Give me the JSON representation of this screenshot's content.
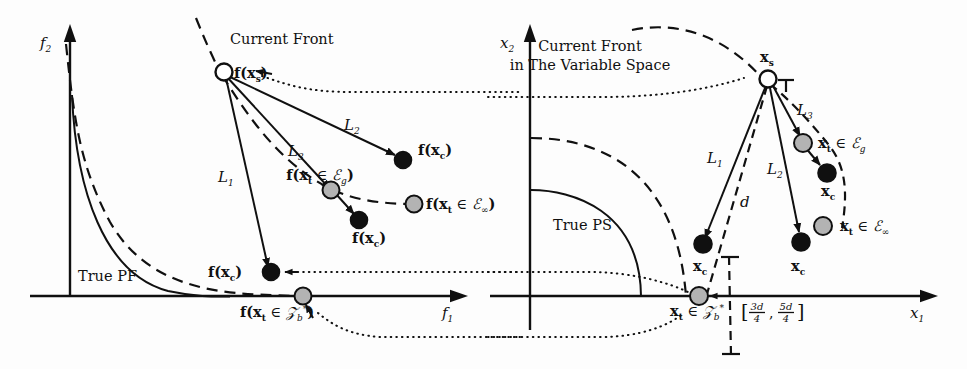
{
  "figure": {
    "title_alt": "Illustration of current front in objective space and variable space",
    "background": "#fdfdfd",
    "ink": "#101010",
    "grey_fill": "#b3b3b3",
    "black_fill": "#101010",
    "white_fill": "#ffffff"
  },
  "left_panel": {
    "name": "objective-space-plot",
    "axis_y_label": "f",
    "axis_y_sub": "2",
    "axis_x_label": "f",
    "axis_x_sub": "1",
    "curve_label_true": "True PF",
    "front_label": "Current Front",
    "labels": {
      "source_point": "f(x",
      "source_point_sub": "s",
      "source_point_close": ")",
      "L1": "L",
      "L1_sub": "1",
      "L2": "L",
      "L2_sub": "2",
      "L3": "L",
      "L3_sub": "3",
      "child_a": "f(x",
      "child_a_sub": "c",
      "child_a_close": ")",
      "child_b": "f(x",
      "child_b_sub": "c",
      "child_b_close": ")",
      "child_c": "f(x",
      "child_c_sub": "c",
      "child_c_close": ")",
      "target_g_open": "f(x",
      "target_g_sub": "t",
      "target_g_mid": " ∈ ",
      "target_g_set": "ℰ",
      "target_g_set_sub": "g",
      "target_g_close": ")",
      "target_inf_open": "f(x",
      "target_inf_sub": "t",
      "target_inf_mid": " ∈ ",
      "target_inf_set": "ℰ",
      "target_inf_set_sub": "∞",
      "target_inf_close": ")",
      "target_zb_open": "f(x",
      "target_zb_sub": "t",
      "target_zb_mid": " ∈ ",
      "target_zb_set": "𝒵",
      "target_zb_set_sub": "b",
      "target_zb_set_sup": "*",
      "target_zb_close": ")"
    }
  },
  "right_panel": {
    "name": "variable-space-plot",
    "axis_y_label": "x",
    "axis_y_sub": "2",
    "axis_x_label": "x",
    "axis_x_sub": "1",
    "curve_label_true": "True PS",
    "front_label_line1": "Current Front",
    "front_label_line2": "in The Variable Space",
    "labels": {
      "source_point": "x",
      "source_point_sub": "s",
      "L1": "L",
      "L1_sub": "1",
      "L2": "L",
      "L2_sub": "2",
      "L3": "L",
      "L3_sub": "3",
      "d_label": "d",
      "child_a": "x",
      "child_a_sub": "c",
      "child_b": "x",
      "child_b_sub": "c",
      "child_c": "x",
      "child_c_sub": "c",
      "target_g_open": "x",
      "target_g_sub": "t",
      "target_g_mid": " ∈ ",
      "target_g_set": "ℰ",
      "target_g_set_sub": "g",
      "target_inf_open": "x",
      "target_inf_sub": "t",
      "target_inf_mid": " ∈ ",
      "target_inf_set": "ℰ",
      "target_inf_set_sub": "∞",
      "target_zb_open": "x",
      "target_zb_sub": "t",
      "target_zb_mid": " ∈ ",
      "target_zb_set": "𝒵",
      "target_zb_set_sub": "b",
      "target_zb_set_sup": "*",
      "interval_open": "[",
      "interval_num1": "3d",
      "interval_den1": "4",
      "interval_comma": ",",
      "interval_num2": "5d",
      "interval_den2": "4",
      "interval_close": "]"
    }
  }
}
